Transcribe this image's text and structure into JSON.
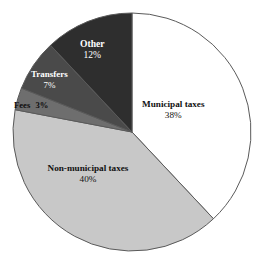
{
  "chart_data": {
    "type": "pie",
    "title": "",
    "labels": [
      "Municipal taxes",
      "Non-municipal taxes",
      "Fees",
      "Transfers",
      "Other"
    ],
    "values": [
      38,
      40,
      3,
      7,
      12
    ],
    "value_suffix": "%",
    "colors": [
      "#ffffff",
      "#c8c8c8",
      "#6e6e6e",
      "#4a4a4a",
      "#2e2e2e"
    ],
    "legend": "none",
    "start_angle_deg": 0,
    "direction": "clockwise",
    "slices": [
      {
        "label": "Municipal taxes",
        "value": 38,
        "value_text": "38%",
        "color": "#ffffff",
        "text_color": "#111111"
      },
      {
        "label": "Non-municipal taxes",
        "value": 40,
        "value_text": "40%",
        "color": "#c8c8c8",
        "text_color": "#111111"
      },
      {
        "label": "Fees",
        "value": 3,
        "value_text": "3%",
        "color": "#6e6e6e",
        "text_color": "#0d0d0d"
      },
      {
        "label": "Transfers",
        "value": 7,
        "value_text": "7%",
        "color": "#4a4a4a",
        "text_color": "#ffffff"
      },
      {
        "label": "Other",
        "value": 12,
        "value_text": "12%",
        "color": "#2e2e2e",
        "text_color": "#ffffff"
      }
    ],
    "geometry": {
      "center_x": 132,
      "center_y": 132,
      "radius": 119,
      "outline_color": "#5a5a5a"
    },
    "background_color": "#ffffff"
  }
}
